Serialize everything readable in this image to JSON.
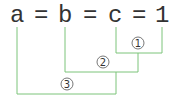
{
  "equation": {
    "tokens": [
      "a",
      "=",
      "b",
      "=",
      "c",
      "=",
      "1"
    ]
  },
  "brackets": [
    {
      "label": "①",
      "number": "1",
      "connects": "c = 1"
    },
    {
      "label": "②",
      "number": "2",
      "connects": "b = (c = 1)"
    },
    {
      "label": "③",
      "number": "3",
      "connects": "a = (b = c = 1)"
    }
  ],
  "colors": {
    "line": "#7dc47a",
    "text": "#333333",
    "circle": "#555555"
  }
}
